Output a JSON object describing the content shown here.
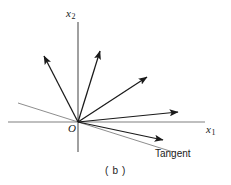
{
  "figure": {
    "caption": "( b )",
    "background_color": "#ffffff",
    "width": 231,
    "height": 185,
    "axes": {
      "origin_label": "O",
      "origin": [
        78,
        122
      ],
      "horizontal": {
        "name": "x1-axis",
        "label_text": "x",
        "label_subscript": "1",
        "color": "#808080",
        "from": [
          8,
          122
        ],
        "to": [
          205,
          122
        ]
      },
      "vertical": {
        "name": "x2-axis",
        "label_text": "x",
        "label_subscript": "2",
        "color": "#808080",
        "from": [
          78,
          22
        ],
        "to": [
          78,
          152
        ]
      }
    },
    "tangent_line": {
      "label": "Tangent",
      "color": "#808080",
      "from": [
        18,
        103
      ],
      "to": [
        173,
        152
      ]
    },
    "vectors": {
      "color": "#1a1a1a",
      "items": [
        {
          "name": "vector-1",
          "from": [
            78,
            122
          ],
          "to": [
            44,
            56
          ]
        },
        {
          "name": "vector-2",
          "from": [
            78,
            122
          ],
          "to": [
            100,
            51
          ]
        },
        {
          "name": "vector-3",
          "from": [
            78,
            122
          ],
          "to": [
            147,
            77
          ]
        },
        {
          "name": "vector-4",
          "from": [
            78,
            122
          ],
          "to": [
            178,
            112
          ]
        },
        {
          "name": "vector-5",
          "from": [
            78,
            122
          ],
          "to": [
            163,
            140
          ]
        }
      ]
    }
  }
}
